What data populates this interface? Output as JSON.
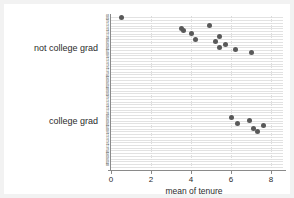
{
  "chart_data": {
    "type": "scatter",
    "title": "",
    "xlabel": "mean of tenure",
    "ylabel": "",
    "xlim": [
      0,
      8.6
    ],
    "xticks": [
      0,
      2,
      4,
      6,
      8
    ],
    "xtick_labels": [
      "0",
      "2",
      "4",
      "6",
      "8"
    ],
    "grid": true,
    "legend": false,
    "group_labels": [
      "not college grad",
      "college grad"
    ],
    "groups": [
      {
        "name": "not college grad",
        "categories": [
          "1968",
          "1969",
          "1970",
          "1971",
          "1972",
          "1973",
          "1975",
          "1977",
          "1978",
          "1980",
          "1982",
          "1983",
          "1985",
          "1987",
          "1988"
        ],
        "points": [
          {
            "category": "1968",
            "value": 0.5
          },
          {
            "category": "1971",
            "value": 4.9
          },
          {
            "category": "1972",
            "value": 3.5
          },
          {
            "category": "1973",
            "value": 3.6
          },
          {
            "category": "1975",
            "value": 4.0
          },
          {
            "category": "1977",
            "value": 5.4
          },
          {
            "category": "1978",
            "value": 4.2
          },
          {
            "category": "1980",
            "value": 5.2
          },
          {
            "category": "1982",
            "value": 5.7
          },
          {
            "category": "1983",
            "value": 5.4
          },
          {
            "category": "1985",
            "value": 6.2
          },
          {
            "category": "1987",
            "value": 7.0
          }
        ]
      },
      {
        "name": "college grad",
        "categories": [
          "1968",
          "1969",
          "1970",
          "1971",
          "1972",
          "1973",
          "1975",
          "1977",
          "1978",
          "1980",
          "1982",
          "1983",
          "1985",
          "1987",
          "1988"
        ],
        "points": [
          {
            "category": "1980",
            "value": 6.0
          },
          {
            "category": "1982",
            "value": 6.9
          },
          {
            "category": "1983",
            "value": 6.3
          },
          {
            "category": "1985",
            "value": 7.6
          },
          {
            "category": "1987",
            "value": 7.1
          },
          {
            "category": "1988",
            "value": 7.3
          }
        ]
      }
    ],
    "ytick_labels_top": [
      "68",
      "69",
      "70",
      "71",
      "72",
      "73",
      "75",
      "77",
      "78",
      "80",
      "82",
      "83",
      "85",
      "87",
      "88",
      "70",
      "71",
      "72",
      "73",
      "75",
      "77",
      "78",
      "80",
      "82",
      "83",
      "85",
      "87",
      "88"
    ],
    "ytick_labels_bottom": [
      "68",
      "69",
      "70",
      "71",
      "72",
      "73",
      "75",
      "77",
      "78",
      "80",
      "82",
      "83",
      "85",
      "87",
      "88",
      "70",
      "71",
      "72",
      "73",
      "75",
      "77",
      "78",
      "80",
      "82",
      "83",
      "85",
      "87",
      "88"
    ]
  },
  "axis": {
    "x_title": "mean of tenure",
    "x_tick_0": "0",
    "x_tick_1": "2",
    "x_tick_2": "4",
    "x_tick_3": "6",
    "x_tick_4": "8"
  },
  "groups": {
    "label_0": "not college grad",
    "label_1": "college grad"
  },
  "style": {
    "point_color": "#595959",
    "grid_color": "#e2e2e2",
    "axis_color": "#8a8a8a",
    "background": "#f2f2f2",
    "plot_background": "#ffffff",
    "text_color": "#2b2b2b"
  }
}
